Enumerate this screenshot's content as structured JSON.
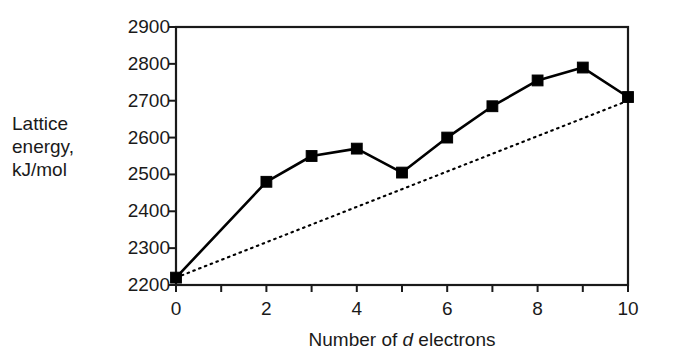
{
  "chart_data": {
    "type": "line",
    "title": "",
    "xlabel": "Number of d electrons",
    "xlabel_parts": {
      "before": "Number of ",
      "italic": "d",
      "after": " electrons"
    },
    "ylabel": "Lattice\nenergy,\nkJ/mol",
    "ylabel_lines": [
      "Lattice",
      "energy,",
      "kJ/mol"
    ],
    "xlim": [
      0,
      10
    ],
    "ylim": [
      2200,
      2900
    ],
    "xticks": [
      0,
      1,
      2,
      3,
      4,
      5,
      6,
      7,
      8,
      9,
      10
    ],
    "xtick_labels": [
      "0",
      "",
      "2",
      "",
      "4",
      "",
      "6",
      "",
      "8",
      "",
      "10"
    ],
    "yticks": [
      2200,
      2300,
      2400,
      2500,
      2600,
      2700,
      2800,
      2900
    ],
    "ytick_labels": [
      "2200",
      "2300",
      "2400",
      "2500",
      "2600",
      "2700",
      "2800",
      "2900"
    ],
    "grid": false,
    "legend": null,
    "series": [
      {
        "name": "measured-lattice-energy",
        "style": "solid",
        "marker": "square",
        "color": "#000000",
        "x": [
          0,
          2,
          3,
          4,
          5,
          6,
          7,
          8,
          9,
          10
        ],
        "values": [
          2220,
          2480,
          2550,
          2570,
          2505,
          2600,
          2685,
          2755,
          2790,
          2710
        ]
      },
      {
        "name": "reference-trend-line",
        "style": "dotted",
        "marker": "none",
        "color": "#000000",
        "x": [
          0,
          10
        ],
        "values": [
          2220,
          2700
        ]
      }
    ]
  },
  "figure": {
    "frame_color": "#1a1a1a",
    "background": "#ffffff"
  }
}
